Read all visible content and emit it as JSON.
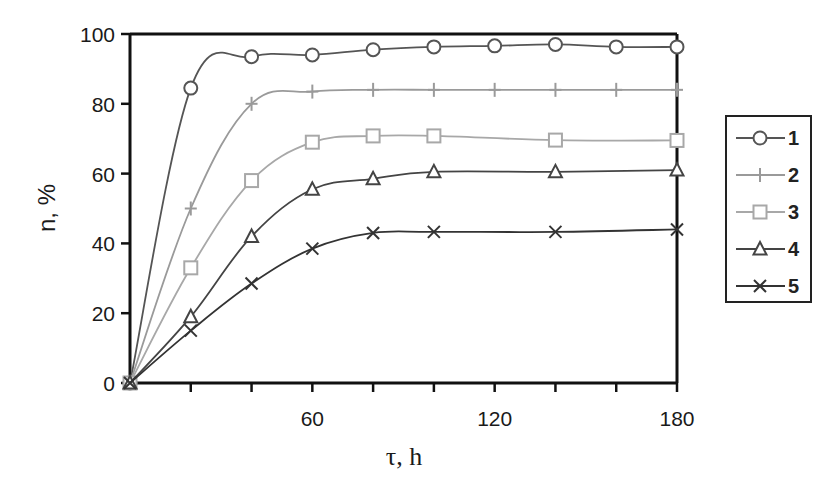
{
  "chart_data": {
    "type": "line",
    "title": "",
    "xlabel": "τ, h",
    "ylabel": "n, %",
    "xlim": [
      0,
      180
    ],
    "ylim": [
      0,
      100
    ],
    "x_ticks_major": [
      20,
      40,
      60,
      80,
      100,
      120,
      140,
      160,
      180
    ],
    "x_tick_labels": [
      "60",
      "120",
      "180"
    ],
    "x_tick_label_values": [
      60,
      120,
      180
    ],
    "y_ticks": [
      0,
      20,
      40,
      60,
      80,
      100
    ],
    "y_tick_labels": [
      "0",
      "20",
      "40",
      "60",
      "80",
      "100"
    ],
    "grid": false,
    "legend_position": "right",
    "series": [
      {
        "name": "1",
        "marker": "circle",
        "color": "#555555",
        "x": [
          0,
          20,
          40,
          60,
          80,
          100,
          120,
          140,
          160,
          180
        ],
        "values": [
          0,
          84.5,
          93.5,
          94,
          95.5,
          96.3,
          96.6,
          97,
          96.3,
          96.3
        ]
      },
      {
        "name": "2",
        "marker": "plus",
        "color": "#9a9a9a",
        "x": [
          0,
          20,
          40,
          60,
          80,
          100,
          120,
          140,
          160,
          180
        ],
        "values": [
          0,
          50,
          80,
          83.5,
          84,
          84,
          84,
          84,
          84,
          84
        ]
      },
      {
        "name": "3",
        "marker": "square",
        "color": "#a8a8a8",
        "x": [
          0,
          20,
          40,
          60,
          80,
          100,
          140,
          180
        ],
        "values": [
          0,
          33,
          58,
          69,
          70.8,
          70.8,
          69.6,
          69.5
        ]
      },
      {
        "name": "4",
        "marker": "triangle",
        "color": "#444444",
        "x": [
          0,
          20,
          40,
          60,
          80,
          100,
          140,
          180
        ],
        "values": [
          0,
          19,
          42,
          55.5,
          58.5,
          60.5,
          60.5,
          61
        ]
      },
      {
        "name": "5",
        "marker": "x",
        "color": "#333333",
        "x": [
          0,
          20,
          40,
          60,
          80,
          100,
          140,
          180
        ],
        "values": [
          0,
          15,
          28.5,
          38.5,
          43,
          43.3,
          43.3,
          44
        ]
      }
    ]
  }
}
